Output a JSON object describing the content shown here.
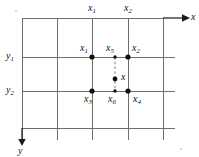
{
  "figure": {
    "type": "grid-interpolation-diagram",
    "background_color": "#ffffff",
    "line_color": "#6e6e6e",
    "axis_color": "#1a1a1a",
    "point_color": "#111111",
    "dashed_color": "#9a9a9a",
    "axes": {
      "x_label": "x",
      "y_label": "y",
      "x_arrow_direction": "right",
      "y_arrow_direction": "down"
    },
    "grid": {
      "vertical_lines_x": [
        22,
        57,
        92,
        128,
        163
      ],
      "horizontal_lines_y": [
        18,
        57,
        91,
        128
      ]
    },
    "column_labels": [
      {
        "text": "x",
        "sub": "1",
        "x": 88,
        "y": 3
      },
      {
        "text": "x",
        "sub": "2",
        "x": 124,
        "y": 3
      }
    ],
    "row_labels": [
      {
        "text": "y",
        "sub": "1",
        "x": 6,
        "y": 51
      },
      {
        "text": "y",
        "sub": "2",
        "x": 6,
        "y": 85
      }
    ],
    "points": [
      {
        "name": "x1",
        "text": "x",
        "sub": "1",
        "cx": 92,
        "cy": 57,
        "r": 2.6,
        "label_x": 80,
        "label_y": 43,
        "filled": true
      },
      {
        "name": "x5",
        "text": "x",
        "sub": "5",
        "cx": 115,
        "cy": 57,
        "r": 1.6,
        "label_x": 107,
        "label_y": 43,
        "filled": true
      },
      {
        "name": "x2",
        "text": "x",
        "sub": "2",
        "cx": 128,
        "cy": 57,
        "r": 2.6,
        "label_x": 132,
        "label_y": 43,
        "filled": true
      },
      {
        "name": "x",
        "text": "x",
        "sub": "",
        "cx": 115,
        "cy": 79,
        "r": 2.4,
        "label_x": 121,
        "label_y": 72,
        "filled": true
      },
      {
        "name": "x3",
        "text": "x",
        "sub": "3",
        "cx": 92,
        "cy": 91,
        "r": 2.6,
        "label_x": 84,
        "label_y": 94,
        "filled": true
      },
      {
        "name": "x6",
        "text": "x",
        "sub": "6",
        "cx": 115,
        "cy": 91,
        "r": 1.6,
        "label_x": 108,
        "label_y": 94,
        "filled": true
      },
      {
        "name": "x4",
        "text": "x",
        "sub": "4",
        "cx": 128,
        "cy": 91,
        "r": 2.6,
        "label_x": 133,
        "label_y": 94,
        "filled": true
      }
    ],
    "dashed_segment": {
      "x": 115,
      "y_top": 57,
      "y_bottom": 91
    },
    "specks": [
      {
        "x": 15,
        "y": 10,
        "size": 2
      },
      {
        "x": 180,
        "y": 148,
        "size": 2
      }
    ]
  }
}
